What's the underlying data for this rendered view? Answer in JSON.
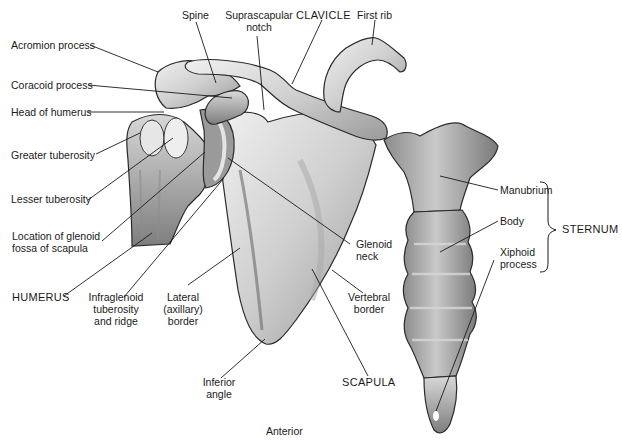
{
  "figure": {
    "view": "Anterior",
    "labels": {
      "spine": "Spine",
      "suprascapular_notch_1": "Suprascapular",
      "suprascapular_notch_2": "notch",
      "clavicle": "CLAVICLE",
      "first_rib": "First rib",
      "acromion": "Acromion process",
      "coracoid": "Coracoid process",
      "head_humerus": "Head of humerus",
      "greater_tuberosity": "Greater tuberosity",
      "lesser_tuberosity": "Lesser tuberosity",
      "glenoid_loc_1": "Location of glenoid",
      "glenoid_loc_2": "fossa of scapula",
      "humerus": "HUMERUS",
      "infraglenoid_1": "Infraglenoid",
      "infraglenoid_2": "tuberosity",
      "infraglenoid_3": "and ridge",
      "lateral_1": "Lateral",
      "lateral_2": "(axillary)",
      "lateral_3": "border",
      "glenoid_neck_1": "Glenoid",
      "glenoid_neck_2": "neck",
      "vertebral_1": "Vertebral",
      "vertebral_2": "border",
      "inferior_1": "Inferior",
      "inferior_2": "angle",
      "scapula": "SCAPULA",
      "manubrium": "Manubrium",
      "body": "Body",
      "xiphoid_1": "Xiphoid",
      "xiphoid_2": "process",
      "sternum": "STERNUM"
    },
    "colors": {
      "bone_fill": "#d9d9d9",
      "bone_shade": "#8a8a8a",
      "outline": "#2a2a2a",
      "leader": "#1a1a1a"
    }
  }
}
